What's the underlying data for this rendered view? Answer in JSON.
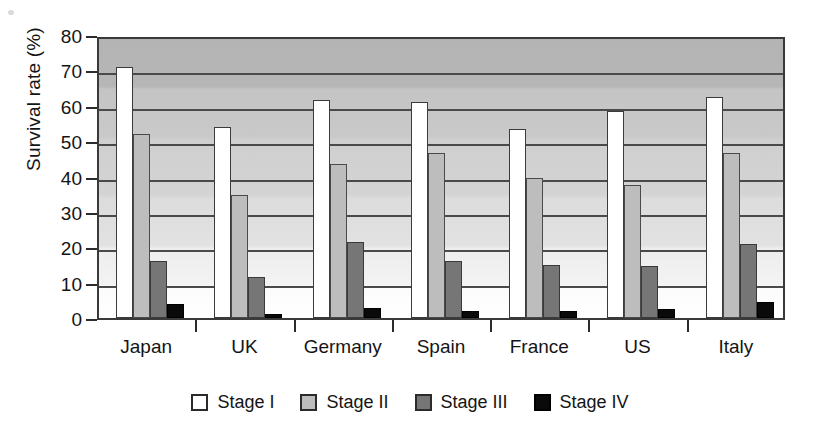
{
  "chart_data": {
    "type": "bar",
    "title": "",
    "xlabel": "",
    "ylabel": "Survival rate (%)",
    "ylim": [
      0,
      80
    ],
    "ytick_values": [
      0,
      10,
      20,
      30,
      40,
      50,
      60,
      70,
      80
    ],
    "ytick_labels": [
      "0",
      "10",
      "20",
      "30",
      "40",
      "50",
      "60",
      "70",
      "80"
    ],
    "grid": true,
    "grid_axis": "y",
    "legend_position": "bottom-center",
    "categories": [
      "Japan",
      "UK",
      "Germany",
      "Spain",
      "France",
      "US",
      "Italy"
    ],
    "series": [
      {
        "name": "Stage I",
        "color": "#ffffff",
        "values": [
          71.0,
          54.0,
          61.5,
          61.0,
          53.5,
          58.5,
          62.5
        ]
      },
      {
        "name": "Stage II",
        "color": "#bdbdbd",
        "values": [
          52.0,
          34.8,
          43.4,
          46.6,
          39.6,
          37.5,
          46.6
        ]
      },
      {
        "name": "Stage III",
        "color": "#767676",
        "values": [
          16.0,
          11.5,
          21.5,
          16.0,
          15.0,
          14.8,
          21.0
        ]
      },
      {
        "name": "Stage IV",
        "color": "#0a0a0a",
        "values": [
          4.0,
          1.0,
          2.7,
          2.0,
          2.1,
          2.5,
          4.5
        ]
      }
    ]
  },
  "legend": {
    "items": [
      {
        "label": "Stage I",
        "swatch": "white-square-icon"
      },
      {
        "label": "Stage II",
        "swatch": "light-gray-square-icon"
      },
      {
        "label": "Stage III",
        "swatch": "dark-gray-square-icon"
      },
      {
        "label": "Stage IV",
        "swatch": "black-square-icon"
      }
    ]
  }
}
